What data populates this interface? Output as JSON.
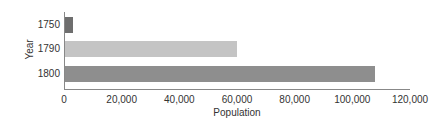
{
  "chart_data": {
    "type": "bar",
    "orientation": "horizontal",
    "title": "",
    "xlabel": "Population",
    "ylabel": "Year",
    "categories": [
      "1750",
      "1790",
      "1800"
    ],
    "values": [
      3000,
      60000,
      108000
    ],
    "bar_colors": [
      "#6e6e6e",
      "#c4c4c4",
      "#8e8e8e"
    ],
    "xlim": [
      0,
      120000
    ],
    "xticks": [
      0,
      20000,
      40000,
      60000,
      80000,
      100000,
      120000
    ],
    "xtick_labels": [
      "0",
      "20,000",
      "40,000",
      "60,000",
      "80,000",
      "100,000",
      "120,000"
    ],
    "grid": false,
    "legend": null
  }
}
